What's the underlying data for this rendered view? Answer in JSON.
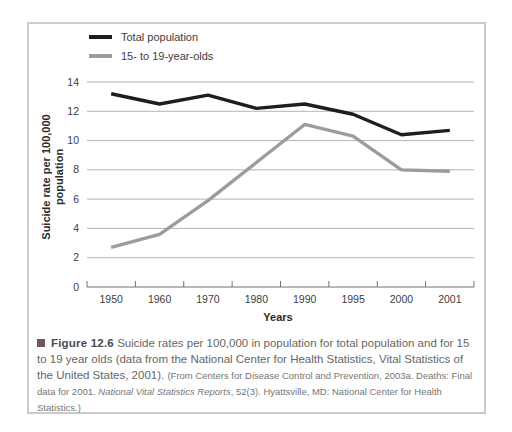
{
  "figure": {
    "label": "Figure 12.6",
    "caption_main": "Suicide rates per 100,000 in population for total population and for 15 to 19 year olds (data from the National Center for Health Statistics, Vital Statistics of the United States, 2001).",
    "source_prefix": "(From Centers for Disease Control and Prevention, 2003a. Deaths: Final data for 2001. ",
    "source_italic": "National Vital Statistics Reports",
    "source_suffix": ", 52(3). Hyattsville, MD: National Center for Health Statistics.)",
    "marker_color": "#6e5a5a"
  },
  "chart_data": {
    "type": "line",
    "categories": [
      "1950",
      "1960",
      "1970",
      "1980",
      "1990",
      "1995",
      "2000",
      "2001"
    ],
    "series": [
      {
        "name": "Total population",
        "color": "#1e1e1e",
        "values": [
          13.2,
          12.5,
          13.1,
          12.2,
          12.5,
          11.8,
          10.4,
          10.7
        ]
      },
      {
        "name": "15- to 19-year-olds",
        "color": "#9c9c9c",
        "values": [
          2.7,
          3.6,
          5.9,
          8.5,
          11.1,
          10.3,
          8.0,
          7.9
        ]
      }
    ],
    "xlabel": "Years",
    "ylabel_line1": "Suicide rate per 100,000",
    "ylabel_line2": "population",
    "yticks": [
      0,
      2,
      4,
      6,
      8,
      10,
      12,
      14
    ],
    "ylim": [
      0,
      14
    ],
    "grid": "horizontal",
    "legend_position": "top-left"
  }
}
